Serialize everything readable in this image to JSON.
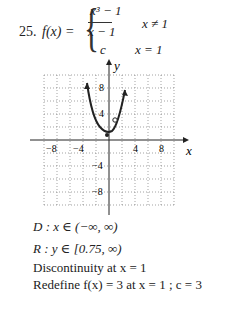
{
  "problem": {
    "number": "25.",
    "function_lhs": "f(x) =",
    "piece1_numerator": "x³ − 1",
    "piece1_denominator": "x − 1",
    "piece1_condition": "x ≠ 1",
    "piece2_value": "c",
    "piece2_condition": "x = 1"
  },
  "graph": {
    "x_axis_label": "x",
    "y_axis_label": "y",
    "x_ticks": [
      "−8",
      "−4",
      "4",
      "8"
    ],
    "y_ticks": [
      "8",
      "4",
      "−4",
      "−8"
    ],
    "open_point": "(1, 3)",
    "vertex": "(−0.5, 0.75)"
  },
  "answers": {
    "domain": "D : x ∈ (−∞, ∞)",
    "range": "R : y ∈ [0.75, ∞)",
    "discontinuity": "Discontinuity at x = 1",
    "redefine": "Redefine  f(x) = 3  at  x = 1 ;  c = 3"
  }
}
